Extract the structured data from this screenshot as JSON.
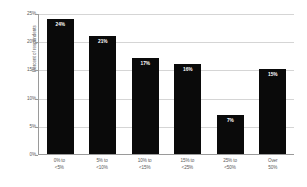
{
  "chart_data": {
    "type": "bar",
    "title": "",
    "subtitle": "",
    "xlabel": "",
    "ylabel": "Percent of respondents",
    "categories": [
      "0% to <5%",
      "5% to <10%",
      "10% to <15%",
      "15% to <25%",
      "25% to <50%",
      "Over 50%"
    ],
    "category_lines": [
      [
        "0% to",
        "<5%"
      ],
      [
        "5% to",
        "<10%"
      ],
      [
        "10% to",
        "<15%"
      ],
      [
        "15% to",
        "<25%"
      ],
      [
        "25% to",
        "<50%"
      ],
      [
        "Over",
        "50%"
      ]
    ],
    "values": [
      24,
      21,
      17,
      16,
      7,
      15
    ],
    "data_labels": [
      "24%",
      "21%",
      "17%",
      "16%",
      "7%",
      "15%"
    ],
    "ylim": [
      0,
      25
    ],
    "ytick_values": [
      25,
      20,
      15,
      10,
      5,
      0
    ],
    "ytick_labels": [
      "25%",
      "20%",
      "15%",
      "10%",
      "5%",
      "0%"
    ],
    "grid": true,
    "legend": false,
    "legend_position": "none",
    "bar_color": "#0A0A0A",
    "data_label_color": "#FFFFFF",
    "gridline_color": "#D5D5D5",
    "axis_color": "#9A9A9A",
    "text_color": "#595959",
    "background_color": "#FFFFFF"
  }
}
